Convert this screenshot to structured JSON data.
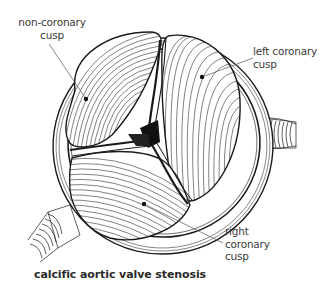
{
  "figure": {
    "title": "calcific aortic valve stenosis",
    "labels": [
      {
        "id": "non-coronary",
        "lines": [
          "non-coronary",
          "cusp"
        ]
      },
      {
        "id": "left-coronary",
        "lines": [
          "left coronary",
          "cusp"
        ]
      },
      {
        "id": "right-coronary",
        "lines": [
          "right",
          "coronary",
          "cusp"
        ]
      }
    ]
  },
  "colors": {
    "ink": "#1a1a1a",
    "label_text": "#3a3a3a",
    "leader_line": "#555555",
    "background": "#ffffff"
  }
}
